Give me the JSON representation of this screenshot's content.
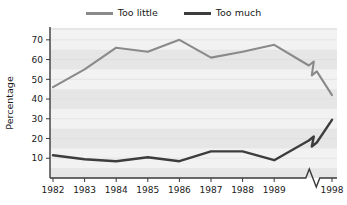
{
  "chart_data": {
    "type": "line",
    "title": "",
    "subtitle": "",
    "xlabel": "",
    "ylabel": "Percentage",
    "x": [
      "1982",
      "1983",
      "1984",
      "1985",
      "1986",
      "1987",
      "1988",
      "1989",
      "1998"
    ],
    "xtick_labels": [
      "1982",
      "1983",
      "1984",
      "1985",
      "1986",
      "1987",
      "1988",
      "1989",
      "1998"
    ],
    "ytick_labels": [
      "10",
      "20",
      "30",
      "40",
      "50",
      "60",
      "70"
    ],
    "yticks": [
      10,
      20,
      30,
      40,
      50,
      60,
      70
    ],
    "ylim": [
      0,
      76
    ],
    "xlim": [
      1981.6,
      1998.4
    ],
    "axis_break": {
      "present": true,
      "between": [
        "1989",
        "1998"
      ],
      "marker": "zigzag"
    },
    "grid": "horizontal-banded",
    "legend_position": "top-center",
    "series": [
      {
        "name": "Too little",
        "color": "#8a8a8a",
        "values": [
          46,
          55,
          66,
          64,
          70,
          61,
          64,
          67.5,
          42
        ],
        "break_values": [
          57,
          54
        ]
      },
      {
        "name": "Too much",
        "color": "#3d3d3d",
        "values": [
          11.5,
          9.5,
          8.5,
          10.5,
          8.5,
          13.5,
          13.5,
          9,
          29.5
        ],
        "break_values": [
          19,
          18
        ]
      }
    ]
  },
  "legend": {
    "items": [
      {
        "label": "Too little",
        "color": "#8a8a8a"
      },
      {
        "label": "Too much",
        "color": "#3d3d3d"
      }
    ]
  },
  "axes": {
    "y_title": "Percentage"
  },
  "colors": {
    "plot_background": "#e6e6e6",
    "band_stripe": "#f2f2f2",
    "axis_line": "#3a3a3a",
    "text": "#1a1a1a",
    "series_light": "#8a8a8a",
    "series_dark": "#3d3d3d"
  }
}
